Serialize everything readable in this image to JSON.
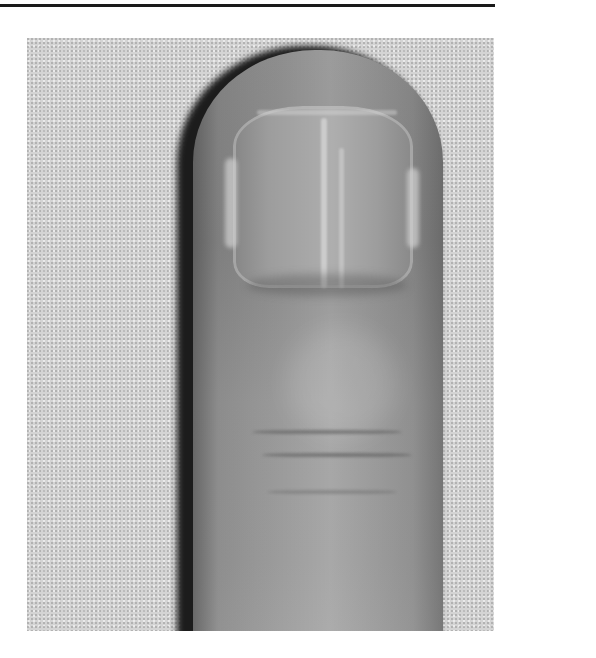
{
  "figure": {
    "rendering": "grayscale",
    "colors": {
      "rule": "#1a1a1a",
      "background_texture": "#d4d4d4",
      "skin": "#8e8e8e",
      "nail": "#9d9d9d",
      "shadow": "#1c1c1c"
    }
  }
}
